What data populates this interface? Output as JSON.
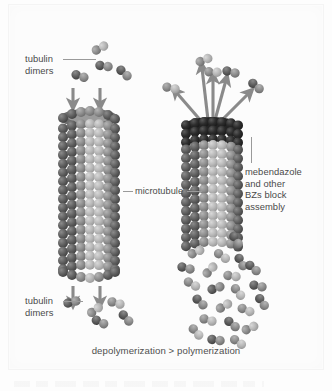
{
  "figure": {
    "caption": "depolymerization > polymerization"
  },
  "labels": {
    "tubulin_dimers_top": "tubulin\ndimers",
    "tubulin_dimers_bottom": "tubulin\ndimers",
    "microtubule": "microtubule",
    "mebendazole": "mebendazole\nand other\nBZs block\nassembly"
  },
  "colors": {
    "background": "#fdfdfd",
    "text": "#4a4a4a",
    "leader_line": "#9a9a9a",
    "arrow": "#8a8a8a",
    "sphere_dark": "#5d5d5d",
    "sphere_mid": "#8e8e8e",
    "sphere_light": "#b9b9b9",
    "sphere_highlight": "#cfcfcf",
    "cap_block": "#2a2a2a"
  },
  "diagram": {
    "type": "schematic",
    "panels": [
      {
        "name": "untreated-microtubule",
        "side": "left",
        "top_process": "polymerization",
        "top_arrow_count": 2,
        "top_arrow_direction": "down",
        "bottom_process": "depolymerization",
        "bottom_arrow_count": 2,
        "bottom_arrow_direction": "down",
        "free_dimers_top": 4,
        "free_dimers_bottom": 5,
        "cylinder": {
          "columns": 7,
          "rows": 17,
          "cap_blocked": false
        }
      },
      {
        "name": "bz-treated-microtubule",
        "side": "right",
        "top_process": "assembly blocked; dimers rejected",
        "top_arrow_count": 5,
        "top_arrow_direction": "outward-up",
        "bottom_process": "depolymerization into free dimers",
        "free_dimers_top": 5,
        "free_dimers_bottom": 22,
        "cylinder": {
          "columns": 7,
          "rows": 12,
          "cap_blocked": true
        }
      }
    ]
  }
}
